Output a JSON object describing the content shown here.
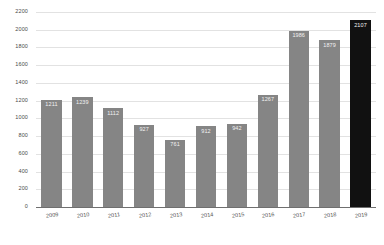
{
  "chart_data": {
    "type": "bar",
    "title": "",
    "xlabel": "",
    "ylabel": "",
    "categories": [
      "2009",
      "2010",
      "2011",
      "2012",
      "2013",
      "2014",
      "2015",
      "2016",
      "2017",
      "2018",
      "2019"
    ],
    "values": [
      1211,
      1239,
      1112,
      927,
      761,
      912,
      942,
      1267,
      1986,
      1879,
      2107
    ],
    "value_labels": [
      "1211",
      "1239",
      "1112",
      "927",
      "761",
      "912",
      "942",
      "1267",
      "1986",
      "1879",
      "2107"
    ],
    "ylim": [
      0,
      2200
    ],
    "ytick_step": 200,
    "ytick_labels": [
      "0",
      "200",
      "400",
      "600",
      "800",
      "1000",
      "1200",
      "1400",
      "1600",
      "1800",
      "2000",
      "2200"
    ],
    "grid": true,
    "legend": "none",
    "highlight_index": 10,
    "colors": {
      "bar": "#858585",
      "bar_highlight": "#111111",
      "gridline": "#e2e2e2",
      "axis": "#6f6f6f",
      "tick_text": "#4a4a4a",
      "value_text": "#f2f2f2",
      "background": "#ffffff"
    }
  }
}
